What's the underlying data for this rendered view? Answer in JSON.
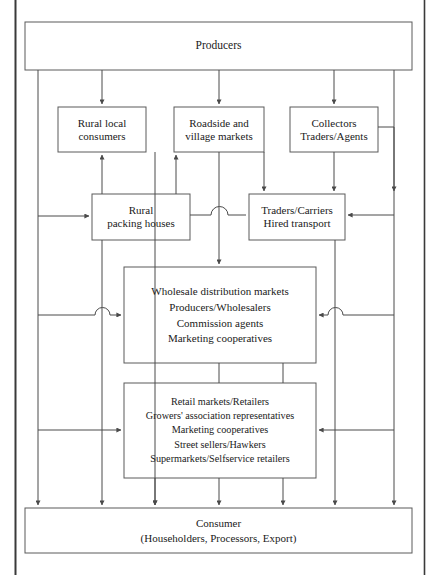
{
  "diagram": {
    "type": "flowchart",
    "frame": {
      "stroke": "#3a3a3a",
      "fill": "#ffffff"
    },
    "line_color": "#4a4a4a",
    "box_stroke": "#5a5a5a",
    "nodes": [
      {
        "id": "producers",
        "name": "producers-box",
        "lines": [
          "Producers"
        ],
        "x": 25,
        "y": 22,
        "w": 387,
        "h": 48
      },
      {
        "id": "rural-local-consumers",
        "name": "rural-local-consumers-box",
        "lines": [
          "Rural local",
          "consumers"
        ],
        "x": 58,
        "y": 107,
        "w": 88,
        "h": 45
      },
      {
        "id": "roadside-village-markets",
        "name": "roadside-village-markets-box",
        "lines": [
          "Roadside and",
          "village markets"
        ],
        "x": 174,
        "y": 107,
        "w": 90,
        "h": 45
      },
      {
        "id": "collectors-traders-agents",
        "name": "collectors-traders-agents-box",
        "lines": [
          "Collectors",
          "Traders/Agents"
        ],
        "x": 290,
        "y": 107,
        "w": 88,
        "h": 45
      },
      {
        "id": "rural-packing-houses",
        "name": "rural-packing-houses-box",
        "lines": [
          "Rural",
          "packing houses"
        ],
        "x": 92,
        "y": 194,
        "w": 98,
        "h": 46
      },
      {
        "id": "traders-carriers",
        "name": "traders-carriers-hired-transport-box",
        "lines": [
          "Traders/Carriers",
          "Hired transport"
        ],
        "x": 249,
        "y": 194,
        "w": 96,
        "h": 46
      },
      {
        "id": "wholesale",
        "name": "wholesale-distribution-markets-box",
        "lines": [
          "Wholesale distribution markets",
          "Producers/Wholesalers",
          "Commission agents",
          "Marketing cooperatives"
        ],
        "x": 124,
        "y": 267,
        "w": 192,
        "h": 96
      },
      {
        "id": "retail",
        "name": "retail-markets-box",
        "lines": [
          "Retail markets/Retailers",
          "Growers' association representatives",
          "Marketing cooperatives",
          "Street sellers/Hawkers",
          "Supermarkets/Selfservice retailers"
        ],
        "x": 124,
        "y": 383,
        "w": 192,
        "h": 95
      },
      {
        "id": "consumer",
        "name": "consumer-box",
        "lines": [
          "Consumer",
          "(Householders, Processors, Export)"
        ],
        "x": 25,
        "y": 508,
        "w": 387,
        "h": 45
      }
    ]
  }
}
